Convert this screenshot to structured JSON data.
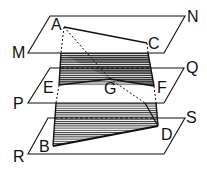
{
  "diagram": {
    "planes": [
      {
        "name": "MN",
        "labels": [
          "M",
          "N"
        ]
      },
      {
        "name": "PQ",
        "labels": [
          "P",
          "Q"
        ]
      },
      {
        "name": "RS",
        "labels": [
          "R",
          "S"
        ]
      }
    ],
    "points": {
      "A": "A",
      "B": "B",
      "C": "C",
      "D": "D",
      "E": "E",
      "F": "F",
      "G": "G",
      "M": "M",
      "N": "N",
      "P": "P",
      "Q": "Q",
      "R": "R",
      "S": "S"
    },
    "colors": {
      "line": "#111111",
      "hatch": "#333333"
    }
  }
}
